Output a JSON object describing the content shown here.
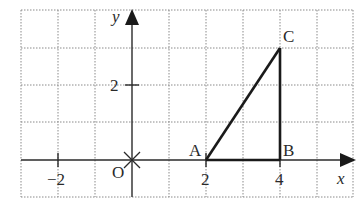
{
  "diagram": {
    "type": "coordinate-plane",
    "axes": {
      "x_label": "x",
      "y_label": "y",
      "origin_label": "O"
    },
    "grid": {
      "x_min": -3,
      "x_max": 6,
      "y_min": -1,
      "y_max": 4,
      "step": 1,
      "style": "dotted"
    },
    "ticks": {
      "x": [
        {
          "value": -2,
          "label": "−2"
        },
        {
          "value": 2,
          "label": "2"
        },
        {
          "value": 4,
          "label": "4"
        }
      ],
      "y": [
        {
          "value": 2,
          "label": "2"
        }
      ]
    },
    "points": [
      {
        "name": "A",
        "x": 2,
        "y": 0
      },
      {
        "name": "B",
        "x": 4,
        "y": 0
      },
      {
        "name": "C",
        "x": 4,
        "y": 3
      }
    ],
    "segments": [
      [
        "A",
        "B"
      ],
      [
        "B",
        "C"
      ],
      [
        "A",
        "C"
      ]
    ],
    "colors": {
      "grid": "#8a8a8a",
      "axis": "#2a2a2a",
      "triangle": "#1a1a1a"
    }
  }
}
